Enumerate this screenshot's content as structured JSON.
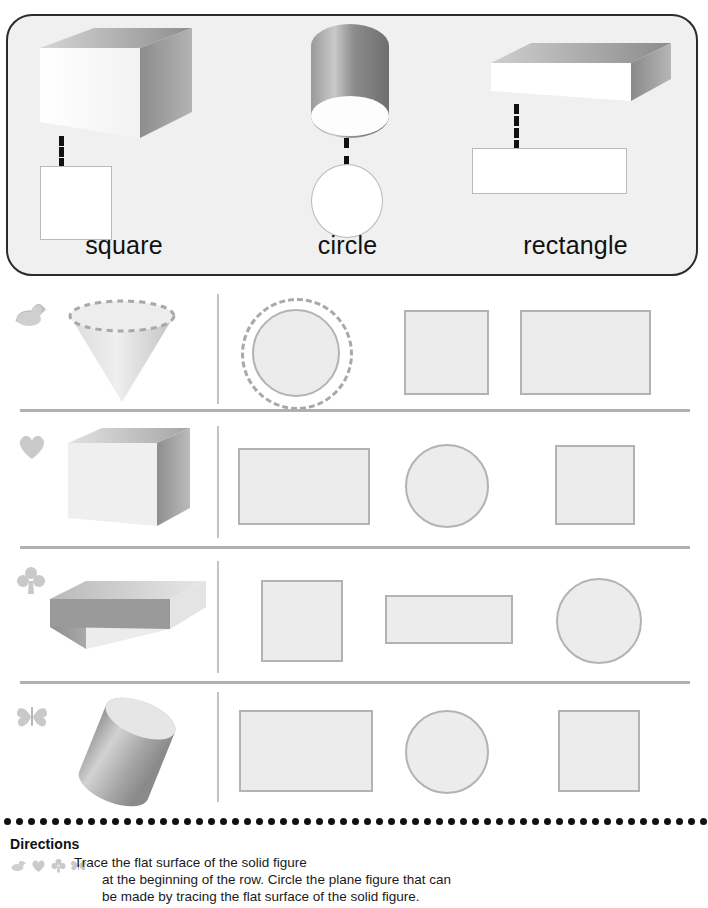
{
  "worksheet": {
    "example_box": {
      "items": [
        {
          "label": "square",
          "solid": "cube",
          "plane": "square",
          "icon": "cube-solid-icon"
        },
        {
          "label": "circle",
          "solid": "cylinder",
          "plane": "circle",
          "icon": "cylinder-solid-icon"
        },
        {
          "label": "rectangle",
          "solid": "rectangular-prism",
          "plane": "rectangle",
          "icon": "rectangular-prism-solid-icon"
        }
      ]
    },
    "rows": [
      {
        "marker": "duck",
        "marker_icon": "duck-icon",
        "solid": "cone",
        "solid_icon": "cone-solid-icon",
        "traced_face": "circle",
        "choices": [
          {
            "shape": "circle",
            "selected": true
          },
          {
            "shape": "square",
            "selected": false
          },
          {
            "shape": "rectangle",
            "selected": false
          }
        ]
      },
      {
        "marker": "heart",
        "marker_icon": "heart-icon",
        "solid": "cube",
        "solid_icon": "cube-solid-icon",
        "traced_face": "square",
        "choices": [
          {
            "shape": "rectangle",
            "selected": false
          },
          {
            "shape": "circle",
            "selected": false
          },
          {
            "shape": "square",
            "selected": false
          }
        ]
      },
      {
        "marker": "club",
        "marker_icon": "club-icon",
        "solid": "rectangular-prism",
        "solid_icon": "rectangular-prism-solid-icon",
        "traced_face": "rectangle",
        "choices": [
          {
            "shape": "square",
            "selected": false
          },
          {
            "shape": "rectangle",
            "selected": false
          },
          {
            "shape": "circle",
            "selected": false
          }
        ]
      },
      {
        "marker": "butterfly",
        "marker_icon": "butterfly-icon",
        "solid": "cylinder",
        "solid_icon": "cylinder-solid-icon",
        "traced_face": "circle",
        "choices": [
          {
            "shape": "rectangle",
            "selected": false
          },
          {
            "shape": "circle",
            "selected": false
          },
          {
            "shape": "square",
            "selected": false
          }
        ]
      }
    ],
    "directions": {
      "title": "Directions",
      "icons": [
        "duck-icon",
        "heart-icon",
        "club-icon",
        "butterfly-icon"
      ],
      "line1": "Trace the flat surface of the solid figure",
      "line2": "at the beginning of the row. Circle the plane figure that can",
      "line3": "be made by tracing the flat surface of the solid figure."
    },
    "colors": {
      "box_border": "#2b2b2b",
      "box_fill": "#f0f0f0",
      "shape_fill": "#ececec",
      "shape_stroke": "#b3b3b3",
      "separator": "#b0b0b0",
      "dot_rule": "#111111",
      "connector": "#111111"
    }
  }
}
